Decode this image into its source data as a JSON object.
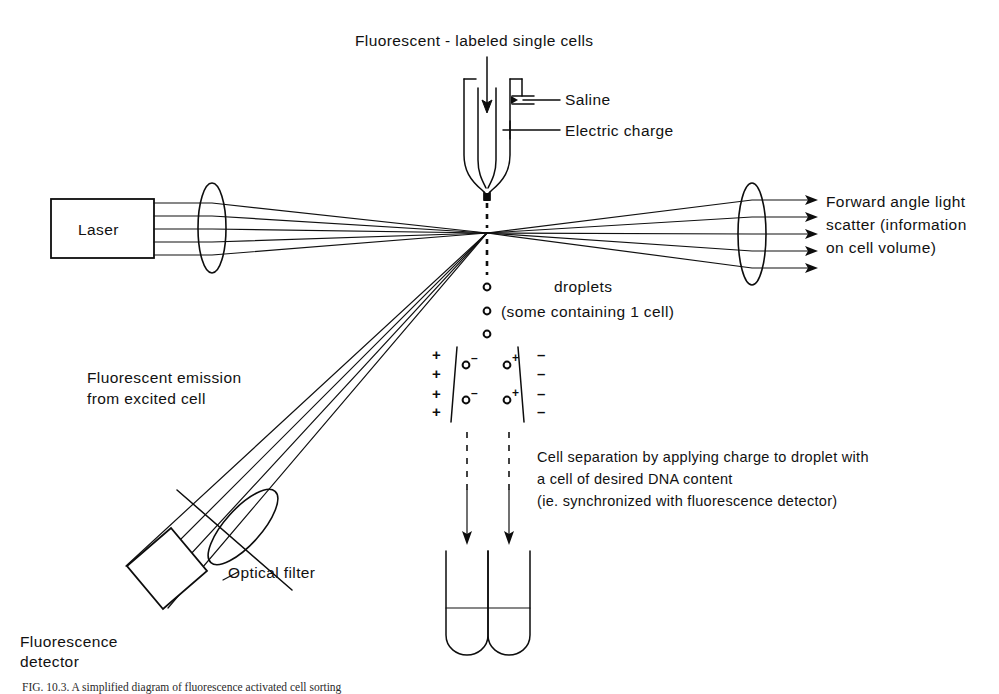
{
  "figure": {
    "title_top": "Fluorescent - labeled single cells",
    "nozzle": {
      "saline_label": "Saline",
      "charge_label": "Electric charge"
    },
    "laser": {
      "box_label": "Laser",
      "beam_count": 5
    },
    "forward_scatter": {
      "line1": "Forward angle light",
      "line2": "scatter (information",
      "line3": "on cell volume)",
      "arrow_count": 5
    },
    "droplets": {
      "line1": "droplets",
      "line2": "(some containing 1 cell)",
      "count": 3
    },
    "fluorescence": {
      "emission_line1": "Fluorescent emission",
      "emission_line2": "from excited cell",
      "filter_label": "Optical filter",
      "detector_line1": "Fluorescence",
      "detector_line2": "detector",
      "beam_count": 4
    },
    "deflection": {
      "plus_sign": "+",
      "minus_sign": "–",
      "plus_count": 4,
      "minus_count": 4,
      "left_droplet_charge": "–",
      "right_droplet_charge": "+",
      "left_droplet_count": 2,
      "right_droplet_count": 2
    },
    "separation_note": {
      "line1": "Cell separation by applying charge to droplet with",
      "line2": "a cell of desired DNA content",
      "line3": "(ie. synchronized with fluorescence detector)"
    },
    "tubes": {
      "count": 2
    },
    "caption": "FIG. 10.3.  A simplified diagram of fluorescence activated cell sorting",
    "colors": {
      "ink": "#0d0d0d",
      "background": "#ffffff"
    }
  }
}
